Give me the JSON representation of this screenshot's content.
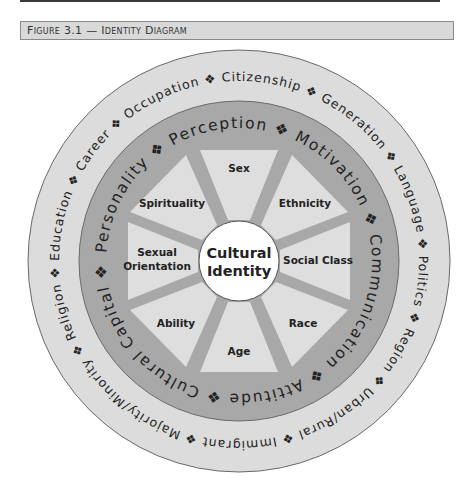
{
  "figure": {
    "title": "Figure 3.1 — Identity Diagram"
  },
  "diagram": {
    "center": {
      "label_line1": "Cultural",
      "label_line2": "Identity"
    },
    "inner_segments": [
      {
        "label": "Sex"
      },
      {
        "label": "Ethnicity"
      },
      {
        "label": "Social Class"
      },
      {
        "label": "Race"
      },
      {
        "label": "Age"
      },
      {
        "label": "Ability"
      },
      {
        "label_line1": "Sexual",
        "label_line2": "Orientation"
      },
      {
        "label": "Spirituality"
      }
    ],
    "middle_ring": {
      "separator": "❖",
      "items": [
        "Personality",
        "Perception",
        "Motivation",
        "Communication",
        "Attitude",
        "Cultural Capital"
      ],
      "text": "Personality ❖ Perception ❖ Motivation ❖ Communication ❖ Attitude ❖ Cultural Capital ❖ "
    },
    "outer_ring": {
      "separator": "❖",
      "items": [
        "Education",
        "Career",
        "Occupation",
        "Citizenship",
        "Generation",
        "Language",
        "Politics",
        "Region",
        "Urban/Rural",
        "Immigrant",
        "Majority/Minority",
        "Religion"
      ],
      "text": "Education ❖ Career ❖ Occupation ❖ Citizenship ❖ Generation ❖ Language ❖ Politics ❖ Region ❖ Urban/Rural ❖ Immigrant ❖ Majority/Minority ❖ Religion ❖ "
    },
    "colors": {
      "outer_ring": "#dcdcdc",
      "middle_ring": "#a8a8a8",
      "segments": "#dedede",
      "spokes": "#a8a8a8",
      "center": "#ffffff",
      "stroke": "#555555"
    }
  }
}
